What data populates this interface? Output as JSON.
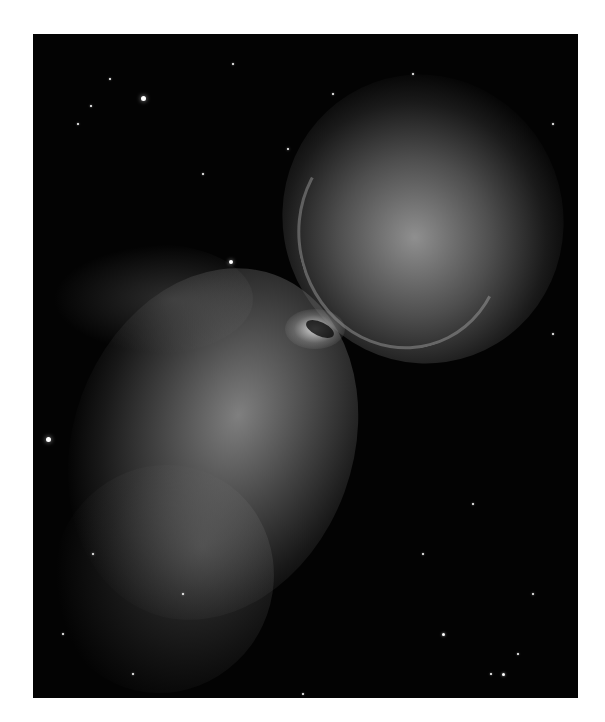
{
  "image": {
    "subject": "Butterfly-shaped bipolar planetary nebula in grayscale",
    "background": "#ffffff",
    "sky_color": "#030303"
  },
  "stars": [
    {
      "x": 110,
      "y": 64,
      "r": 2.5
    },
    {
      "x": 77,
      "y": 45,
      "r": 1
    },
    {
      "x": 58,
      "y": 72,
      "r": 1
    },
    {
      "x": 45,
      "y": 90,
      "r": 1
    },
    {
      "x": 200,
      "y": 30,
      "r": 1
    },
    {
      "x": 255,
      "y": 115,
      "r": 1.2
    },
    {
      "x": 300,
      "y": 60,
      "r": 1
    },
    {
      "x": 170,
      "y": 140,
      "r": 1
    },
    {
      "x": 198,
      "y": 228,
      "r": 2
    },
    {
      "x": 15,
      "y": 405,
      "r": 2.5
    },
    {
      "x": 60,
      "y": 520,
      "r": 1.2
    },
    {
      "x": 30,
      "y": 600,
      "r": 1
    },
    {
      "x": 100,
      "y": 640,
      "r": 1
    },
    {
      "x": 390,
      "y": 520,
      "r": 1
    },
    {
      "x": 440,
      "y": 470,
      "r": 1
    },
    {
      "x": 500,
      "y": 560,
      "r": 1.2
    },
    {
      "x": 485,
      "y": 620,
      "r": 1
    },
    {
      "x": 470,
      "y": 640,
      "r": 1.5
    },
    {
      "x": 458,
      "y": 640,
      "r": 1
    },
    {
      "x": 410,
      "y": 600,
      "r": 1.5
    },
    {
      "x": 520,
      "y": 300,
      "r": 1
    },
    {
      "x": 380,
      "y": 40,
      "r": 1
    },
    {
      "x": 520,
      "y": 90,
      "r": 1
    },
    {
      "x": 270,
      "y": 660,
      "r": 1
    },
    {
      "x": 150,
      "y": 560,
      "r": 1
    }
  ]
}
